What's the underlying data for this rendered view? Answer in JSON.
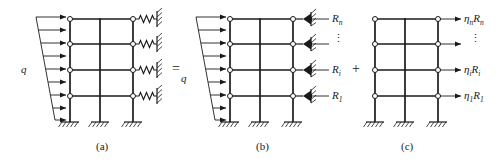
{
  "figure": {
    "kind": "structural-superposition-diagram",
    "stroke_color": "#1a1a1a",
    "background_color": "#ffffff"
  },
  "operators": {
    "equals": "=",
    "plus": "+"
  },
  "panels": [
    {
      "id": "a",
      "caption": "(a)",
      "load_label": "q",
      "right_support": "spring-to-wall",
      "reaction_labels": [],
      "vertical_dots": ""
    },
    {
      "id": "b",
      "caption": "(b)",
      "load_label": "q",
      "right_support": "rigid-link-hatched",
      "reaction_labels": [
        {
          "base": "R",
          "sub": "n"
        },
        {
          "base": "R",
          "sub": "i"
        },
        {
          "base": "R",
          "sub": "1"
        }
      ],
      "vertical_dots": "⋮"
    },
    {
      "id": "c",
      "caption": "(c)",
      "load_label": "",
      "right_support": "none",
      "reaction_labels": [
        {
          "eta": "η",
          "eta_sub": "n",
          "base": "R",
          "sub": "n"
        },
        {
          "eta": "η",
          "eta_sub": "i",
          "base": "R",
          "sub": "i"
        },
        {
          "eta": "η",
          "eta_sub": "1",
          "base": "R",
          "sub": "1"
        }
      ],
      "vertical_dots": "⋮"
    }
  ],
  "frame": {
    "storeys": 4,
    "columns": 3,
    "joint_marker": "hinge-circle",
    "base_support": "fixed-hatched"
  }
}
